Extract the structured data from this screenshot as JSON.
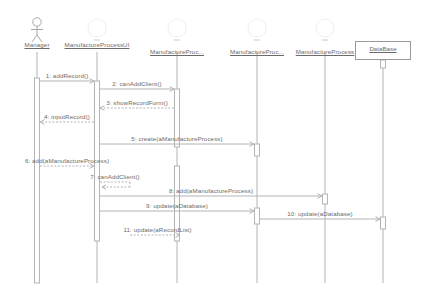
{
  "diagram": {
    "kind": "uml-sequence-diagram",
    "width": 423,
    "height": 299,
    "background": "#ffffff",
    "line_color": "#b4b4b4",
    "text_color": "#6b6b6b",
    "box_border_color": "#9a9a9a"
  },
  "participants": [
    {
      "id": "manager",
      "label": "Manager",
      "icon": "actor-stick-figure-icon",
      "x": 37,
      "boxed": false
    },
    {
      "id": "ui",
      "label": "ManufactureProcessUI",
      "icon": "circle-icon",
      "x": 97,
      "boxed": false
    },
    {
      "id": "proc1",
      "label": "ManufactureProc...",
      "icon": "circle-icon",
      "x": 177,
      "boxed": false
    },
    {
      "id": "proc2",
      "label": "ManufactureProc...",
      "icon": "circle-icon",
      "x": 257,
      "boxed": false
    },
    {
      "id": "proc3",
      "label": "ManufactureProcess",
      "icon": "circle-icon",
      "x": 325,
      "boxed": false
    },
    {
      "id": "database",
      "label": "DataBase",
      "icon": "none",
      "x": 383,
      "boxed": true
    }
  ],
  "messages": [
    {
      "n": "1",
      "label": "1: addRecord()",
      "from": "manager",
      "to": "ui",
      "y": 81,
      "style": "solid",
      "dir": "right"
    },
    {
      "n": "2",
      "label": "2: canAddClient()",
      "from": "ui",
      "to": "proc1",
      "y": 89,
      "style": "solid",
      "dir": "right"
    },
    {
      "n": "3",
      "label": "3: showRecordForm()",
      "from": "proc1",
      "to": "ui",
      "y": 108,
      "style": "dashed",
      "dir": "left"
    },
    {
      "n": "4",
      "label": "4: inputRecord()",
      "from": "ui",
      "to": "manager",
      "y": 122,
      "style": "dashed",
      "dir": "left"
    },
    {
      "n": "5",
      "label": "5: create(aManufactureProcess)",
      "from": "ui",
      "to": "proc2",
      "y": 144,
      "style": "solid",
      "dir": "right"
    },
    {
      "n": "6",
      "label": "6: add(aManufactureProcess)",
      "from": "manager",
      "to": "ui",
      "y": 166,
      "style": "dashed",
      "dir": "right"
    },
    {
      "n": "7",
      "label": "7: canAddClient()",
      "from": "ui",
      "to": "ui",
      "y": 182,
      "style": "dashed",
      "dir": "self"
    },
    {
      "n": "8",
      "label": "8: add(aManufactureProcess)",
      "from": "ui",
      "to": "proc3",
      "y": 196,
      "style": "solid",
      "dir": "right"
    },
    {
      "n": "9",
      "label": "9: update(aDatabase)",
      "from": "ui",
      "to": "proc2",
      "y": 211,
      "style": "solid",
      "dir": "right"
    },
    {
      "n": "10",
      "label": "10: update(aDatabase)",
      "from": "proc2",
      "to": "database",
      "y": 219,
      "style": "solid",
      "dir": "right"
    },
    {
      "n": "11",
      "label": "11: update(aRecordList)",
      "from": "proc1",
      "to": "ui",
      "y": 235,
      "style": "dashed",
      "dir": "left"
    }
  ]
}
